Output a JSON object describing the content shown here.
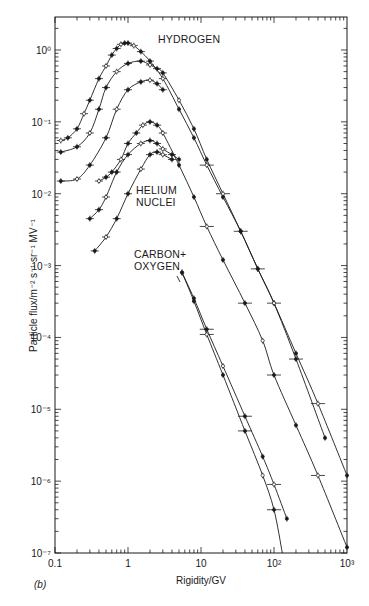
{
  "chart_data": {
    "type": "scatter",
    "title": "",
    "panel_label": "(b)",
    "xlabel": "Rigidity/GV",
    "ylabel": "Particle flux/m⁻² s⁻¹ sr⁻¹ MV⁻¹",
    "xscale": "log",
    "yscale": "log",
    "xlim": [
      0.1,
      1000
    ],
    "ylim": [
      1e-07,
      3
    ],
    "x_ticks": [
      "0.1",
      "1",
      "10",
      "10²",
      "10³"
    ],
    "y_ticks": [
      "10⁰",
      "10⁻¹",
      "10⁻²",
      "10⁻³",
      "10⁻⁴",
      "10⁻⁵",
      "10⁻⁶",
      "10⁻⁷"
    ],
    "grid": false,
    "legend": null,
    "annotations": [
      "HYDROGEN",
      "HELIUM NUCLEI",
      "CARBON+ OXYGEN"
    ],
    "series": [
      {
        "name": "Hydrogen (solar min)",
        "group": "HYDROGEN",
        "x": [
          0.12,
          0.15,
          0.2,
          0.25,
          0.3,
          0.4,
          0.5,
          0.6,
          0.7,
          0.8,
          0.9,
          1.0,
          1.2,
          1.5,
          2,
          3,
          5,
          8,
          12,
          20,
          35,
          60,
          100,
          200,
          400,
          1000
        ],
        "y": [
          0.055,
          0.06,
          0.08,
          0.13,
          0.2,
          0.4,
          0.6,
          0.85,
          1.05,
          1.2,
          1.25,
          1.25,
          1.15,
          0.95,
          0.7,
          0.4,
          0.15,
          0.06,
          0.025,
          0.009,
          0.003,
          0.0009,
          0.0003,
          6e-05,
          1.2e-05,
          1.2e-06
        ]
      },
      {
        "name": "Hydrogen (intermediate)",
        "group": "HYDROGEN",
        "x": [
          0.12,
          0.2,
          0.3,
          0.4,
          0.5,
          0.7,
          1.0,
          1.5,
          2,
          2.5,
          3,
          5,
          8,
          12,
          20,
          35,
          60,
          100,
          200,
          500
        ],
        "y": [
          0.038,
          0.045,
          0.07,
          0.15,
          0.3,
          0.5,
          0.65,
          0.7,
          0.62,
          0.55,
          0.48,
          0.2,
          0.08,
          0.03,
          0.01,
          0.003,
          0.0009,
          0.0003,
          5e-05,
          4e-06
        ]
      },
      {
        "name": "Hydrogen (solar max)",
        "group": "HYDROGEN",
        "x": [
          0.12,
          0.2,
          0.3,
          0.5,
          0.7,
          1.0,
          1.5,
          2,
          2.5,
          3
        ],
        "y": [
          0.015,
          0.016,
          0.025,
          0.06,
          0.15,
          0.28,
          0.36,
          0.38,
          0.34,
          0.28
        ]
      },
      {
        "name": "Helium (solar min)",
        "group": "HELIUM NUCLEI",
        "x": [
          0.4,
          0.5,
          0.6,
          0.8,
          1.0,
          1.3,
          1.6,
          2,
          2.5,
          3,
          5,
          8,
          12,
          20,
          40,
          70,
          100,
          200,
          400,
          1000
        ],
        "y": [
          0.015,
          0.017,
          0.02,
          0.03,
          0.05,
          0.07,
          0.09,
          0.1,
          0.09,
          0.07,
          0.025,
          0.009,
          0.0035,
          0.0012,
          0.0003,
          9e-05,
          3e-05,
          6e-06,
          1.2e-06,
          1.2e-07
        ]
      },
      {
        "name": "Helium (intermediate)",
        "group": "HELIUM NUCLEI",
        "x": [
          0.3,
          0.4,
          0.5,
          0.7,
          1.0,
          1.5,
          2,
          2.5,
          3,
          4,
          5
        ],
        "y": [
          0.0045,
          0.006,
          0.009,
          0.02,
          0.035,
          0.05,
          0.055,
          0.05,
          0.042,
          0.035,
          0.03
        ]
      },
      {
        "name": "Helium (solar max)",
        "group": "HELIUM NUCLEI",
        "x": [
          0.35,
          0.5,
          0.7,
          1.0,
          1.5,
          2,
          2.5,
          3,
          4
        ],
        "y": [
          0.0016,
          0.0025,
          0.0045,
          0.01,
          0.022,
          0.035,
          0.038,
          0.035,
          0.03
        ]
      },
      {
        "name": "Carbon+Oxygen (A)",
        "group": "CARBON+ OXYGEN",
        "x": [
          5.5,
          8,
          12,
          20,
          40,
          70,
          100,
          150
        ],
        "y": [
          0.0008,
          0.00035,
          0.00013,
          4e-05,
          8e-06,
          2.2e-06,
          9e-07,
          3e-07
        ]
      },
      {
        "name": "Carbon+Oxygen (B)",
        "group": "CARBON+ OXYGEN",
        "x": [
          5.5,
          8,
          12,
          20,
          40,
          70,
          100,
          130
        ],
        "y": [
          0.0008,
          0.00032,
          0.00011,
          3e-05,
          5e-06,
          1.2e-06,
          4e-07,
          1e-07
        ]
      }
    ]
  },
  "labels": {
    "hydrogen": "HYDROGEN",
    "helium_line1": "HELIUM",
    "helium_line2": "NUCLEI",
    "carbon_line1": "CARBON+",
    "carbon_line2": "OXYGEN",
    "xlabel": "Rigidity/GV",
    "ylabel": "Particle flux/m⁻² s⁻¹ sr⁻¹ MV⁻¹",
    "panel": "(b)"
  },
  "axis": {
    "x_ticks": [
      {
        "label": "0.1",
        "value": 0.1
      },
      {
        "label": "1",
        "value": 1
      },
      {
        "label": "10",
        "value": 10
      },
      {
        "label": "10²",
        "value": 100
      },
      {
        "label": "10³",
        "value": 1000
      }
    ],
    "y_ticks": [
      {
        "label": "10⁰",
        "value": 1
      },
      {
        "label": "10⁻¹",
        "value": 0.1
      },
      {
        "label": "10⁻²",
        "value": 0.01
      },
      {
        "label": "10⁻³",
        "value": 0.001
      },
      {
        "label": "10⁻⁴",
        "value": 0.0001
      },
      {
        "label": "10⁻⁵",
        "value": 1e-05
      },
      {
        "label": "10⁻⁶",
        "value": 1e-06
      },
      {
        "label": "10⁻⁷",
        "value": 1e-07
      }
    ]
  },
  "colors": {
    "ink": "#1a1a1a",
    "background": "#ffffff"
  }
}
